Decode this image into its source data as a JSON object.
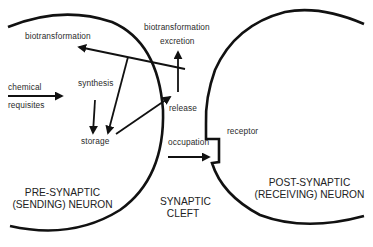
{
  "diagram": {
    "type": "synapse-pharmacology-schematic",
    "labels": {
      "biotransformation_left": "biotransformation",
      "biotransformation_right": "biotransformation",
      "excretion": "excretion",
      "chemical": "chemical",
      "requisites": "requisites",
      "synthesis": "synthesis",
      "storage": "storage",
      "release": "release",
      "occupation": "occupation",
      "receptor": "receptor",
      "pre_line1": "PRE-SYNAPTIC",
      "pre_line2": "(SENDING) NEURON",
      "cleft_line1": "SYNAPTIC",
      "cleft_line2": "CLEFT",
      "post_line1": "POST-SYNAPTIC",
      "post_line2": "(RECEIVING) NEURON"
    },
    "colors": {
      "stroke": "#111111",
      "text": "#2b2b2b",
      "background": "#ffffff"
    },
    "flows": [
      {
        "from": "chemical requisites",
        "to": "synthesis"
      },
      {
        "from": "synthesis",
        "to": "storage"
      },
      {
        "from": "storage",
        "to": "release"
      },
      {
        "from": "release",
        "to": "biotransformation / excretion"
      },
      {
        "from": "release (reuptake)",
        "to": "storage"
      },
      {
        "from": "reuptake",
        "to": "biotransformation"
      },
      {
        "from": "release",
        "to": "occupation of receptor"
      }
    ]
  }
}
